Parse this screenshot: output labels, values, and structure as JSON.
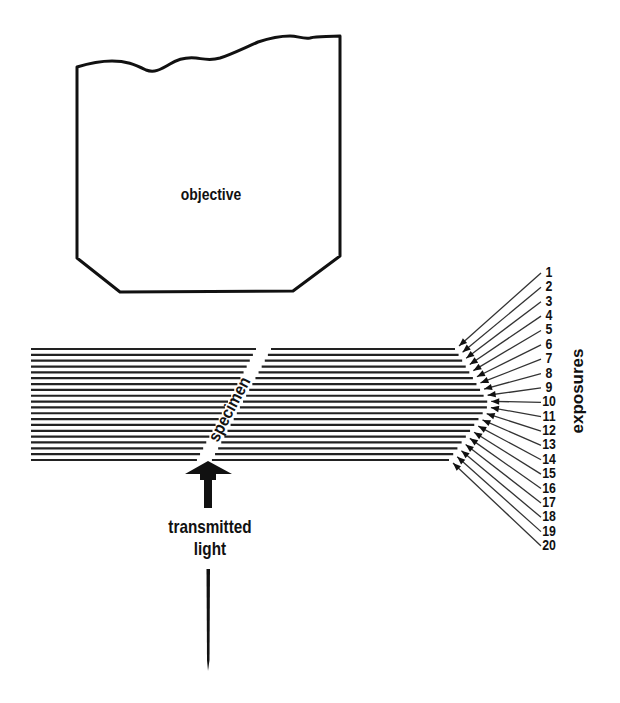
{
  "diagram": {
    "objective_label": "objective",
    "specimen_label": "specimen",
    "light_label_line1": "transmitted",
    "light_label_line2": "light",
    "exposures_label": "exposures",
    "exposure_numbers": [
      "1",
      "2",
      "3",
      "4",
      "5",
      "6",
      "7",
      "8",
      "9",
      "10",
      "11",
      "12",
      "13",
      "14",
      "15",
      "16",
      "17",
      "18",
      "19",
      "20"
    ],
    "line_count": 20,
    "colors": {
      "ink": "#111111",
      "background": "#ffffff"
    }
  }
}
